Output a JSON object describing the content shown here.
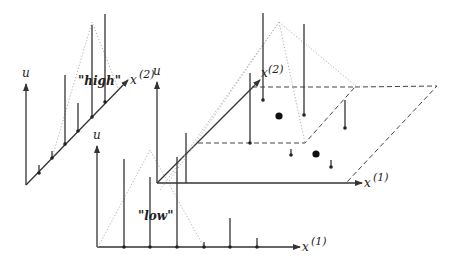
{
  "labels": {
    "u": "u",
    "x1": "x",
    "x1_sup": "(1)",
    "x2": "x",
    "x2_sup": "(2)",
    "high": "\"high\"",
    "low": "\"low\""
  },
  "panels": {
    "high": {
      "title": "\"high\"",
      "axis_vertical": "u",
      "axis_horizontal": "x(2)",
      "sample_count": 6
    },
    "low": {
      "title": "\"low\"",
      "axis_vertical": "u",
      "axis_horizontal": "x(1)",
      "sample_count": 6
    },
    "joint": {
      "axis_vertical": "u",
      "axes_horizontal": [
        "x(1)",
        "x(2)"
      ],
      "large_dots": 2
    }
  }
}
